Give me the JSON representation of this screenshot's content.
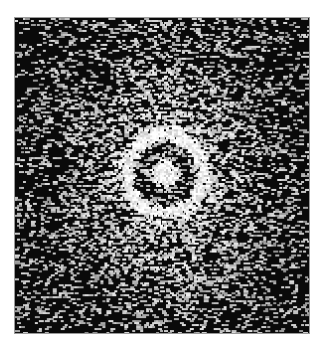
{
  "figure": {
    "frame": {
      "x": 14,
      "y": 17,
      "width": 296,
      "height": 317
    },
    "background_color": "#ffffff",
    "image_base_color": "#0a0a0a",
    "ring": {
      "center_x": 149,
      "center_y": 156,
      "radius": 39,
      "thickness": 11,
      "intensity": 0.85
    },
    "central_spot": {
      "radius": 9,
      "intensity": 1.0
    },
    "glow": {
      "radius_x": 120,
      "radius_y": 170,
      "intensity": 0.55
    },
    "speckle": {
      "density": 0.5,
      "grain_w": 3,
      "grain_h": 2,
      "seed": 7
    }
  }
}
